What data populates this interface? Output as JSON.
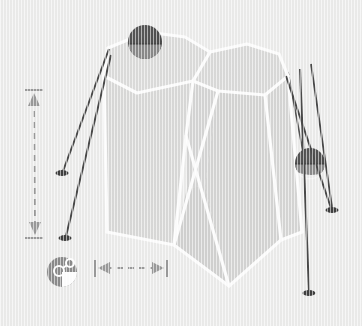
{
  "canvas": {
    "width": 362,
    "height": 326,
    "background_color": "#ececeb",
    "texture": "vertical-stripe-paper"
  },
  "palette": {
    "background": "#ececeb",
    "face_light": "#dededd",
    "face_mid": "#d8d8d7",
    "face_dark": "#d2d2d1",
    "edge_white": "#fdfdfd",
    "sphere_dark": "#4d4d4d",
    "sphere_mid": "#8c8c8c",
    "sphere_highlight": "#f2f2f2",
    "leg_dark": "#4a4a4a",
    "dimension_gray": "#9a9a9a",
    "icon_gray": "#8b8b8b",
    "icon_white": "#ffffff"
  },
  "diagram": {
    "solid": {
      "name": "faceted-polyhedron",
      "faces": [
        {
          "id": "face-top-left",
          "fill": "#dcdcdb",
          "points": "108,48 147,32 185,37 210,52 193,81 137,93 104,76"
        },
        {
          "id": "face-top-right",
          "fill": "#dadad9",
          "points": "210,52 247,44 279,54 288,76 265,95 218,91 193,81"
        },
        {
          "id": "face-front-left",
          "fill": "#d9d9d8",
          "points": "104,76 137,93 193,81 186,136 174,245 107,232"
        },
        {
          "id": "face-front-mid",
          "fill": "#d5d5d4",
          "points": "193,81 218,91 205,186 187,188 186,136"
        },
        {
          "id": "face-front-right",
          "fill": "#d4d4d3",
          "points": "218,91 265,95 281,240 229,286 205,186"
        },
        {
          "id": "face-bottom-wedge",
          "fill": "#d1d1d0",
          "points": "174,245 187,188 205,186 229,286"
        },
        {
          "id": "face-right-sliver",
          "fill": "#d6d6d5",
          "points": "265,95 288,76 302,232 281,240"
        }
      ],
      "edges": [
        "108,48 147,32",
        "147,32 185,37",
        "185,37 210,52",
        "210,52 247,44",
        "247,44 279,54",
        "279,54 288,76",
        "288,76 265,95",
        "265,95 218,91",
        "218,91 193,81",
        "193,81 210,52",
        "193,81 137,93",
        "137,93 104,76",
        "104,76 108,48",
        "104,76 107,232",
        "107,232 174,245",
        "174,245 229,286",
        "229,286 281,240",
        "281,240 302,232",
        "302,232 288,76",
        "193,81 186,136",
        "186,136 174,245",
        "186,136 205,186",
        "187,188 218,91",
        "187,188 229,286",
        "205,186 265,95",
        "265,95 281,240"
      ]
    },
    "spheres": [
      {
        "id": "sphere-top",
        "label": "upper-node-sphere",
        "cx": 145,
        "cy": 42,
        "r": 17,
        "fill": "#4d4d4d",
        "band_fill": "#8d8d8d"
      },
      {
        "id": "sphere-right",
        "label": "right-node-sphere",
        "cx": 310,
        "cy": 163,
        "r": 15,
        "fill": "#4d4d4d",
        "band_fill": "#8d8d8d",
        "highlight_fill": "#f4f4f4"
      }
    ],
    "legs": [
      {
        "id": "leg-left-upper",
        "from": "108,49",
        "to": "62,172",
        "foot": "62,173"
      },
      {
        "id": "leg-left-lower",
        "from": "110,55",
        "to": "65,237",
        "foot": "65,238"
      },
      {
        "id": "leg-right-inner",
        "from": "288,72",
        "to": "303,150",
        "foot": null
      },
      {
        "id": "leg-right-outer",
        "from": "285,77",
        "to": "331,210",
        "foot": "332,211"
      },
      {
        "id": "leg-right-long",
        "from": "300,70",
        "to": "309,292",
        "foot": "309,293"
      },
      {
        "id": "leg-right-far",
        "from": "312,65",
        "to": "332,208",
        "foot": null
      }
    ],
    "annotations": {
      "vertical_dimension": {
        "id": "vertical-dimension-arrow",
        "x": 34,
        "y_top": 90,
        "y_bottom": 238,
        "cap_half_width": 9,
        "style": "dashed-double-arrow",
        "color": "#9a9a9a",
        "value_label": ""
      },
      "horizontal_dimension": {
        "id": "horizontal-dimension-arrow",
        "y": 268,
        "x_left": 95,
        "x_right": 167,
        "cap_half_height": 8,
        "style": "dashed-double-arrow",
        "color": "#9a9a9a",
        "value_label": ""
      },
      "badge_icon": {
        "id": "measurement-badge-icon",
        "cx": 62,
        "cy": 272,
        "r": 15,
        "fill": "#8b8b8b",
        "glyph": "circles-and-wedge"
      }
    }
  },
  "labels": {
    "vertical_dimension": "",
    "horizontal_dimension": "",
    "badge": ""
  }
}
